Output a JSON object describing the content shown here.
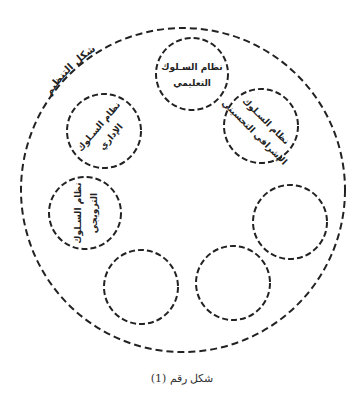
{
  "outer": {
    "label": "شكل التنظيم",
    "cx": 183,
    "cy": 190,
    "r": 162
  },
  "systems": [
    {
      "id": "teaching",
      "line1": "نظام السـلوك",
      "line2": "التعليمي",
      "cx": 192,
      "cy": 74,
      "r": 36,
      "rotate": 0
    },
    {
      "id": "administrative",
      "line1": "نظام السـلوك",
      "line2": "الإداري",
      "cx": 104,
      "cy": 131,
      "r": 37,
      "rotate": -50
    },
    {
      "id": "supervisory",
      "line1": "نظام السـلوك",
      "line2": "الإشرافي التحسيني",
      "cx": 261,
      "cy": 126,
      "r": 37,
      "rotate": 45
    },
    {
      "id": "promotional",
      "line1": "نظام السـلوك",
      "line2": "الترويجي",
      "cx": 85,
      "cy": 213,
      "r": 36,
      "rotate": -90
    },
    {
      "id": "empty-right",
      "line1": "",
      "line2": "",
      "cx": 290,
      "cy": 222,
      "r": 37,
      "rotate": 0
    },
    {
      "id": "empty-bottom-left",
      "line1": "",
      "line2": "",
      "cx": 141,
      "cy": 287,
      "r": 37,
      "rotate": 0
    },
    {
      "id": "empty-bottom-right",
      "line1": "",
      "line2": "",
      "cx": 233,
      "cy": 283,
      "r": 37,
      "rotate": 0
    }
  ],
  "caption": "شكل رقم (1)",
  "stroke_color": "#222222"
}
